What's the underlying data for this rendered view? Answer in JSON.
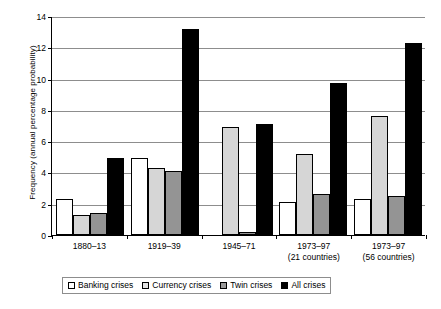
{
  "chart_data": {
    "type": "bar",
    "title": "",
    "xlabel": "",
    "ylabel": "Frequency (annual percentage probability)",
    "ylim": [
      0,
      14
    ],
    "ytick_step": 2,
    "yticks": [
      0,
      2,
      4,
      6,
      8,
      10,
      12,
      14
    ],
    "ytick_labels": [
      "0",
      "2",
      "4",
      "6",
      "8",
      "10",
      "12",
      "14"
    ],
    "grid": "horizontal",
    "legend_position": "bottom",
    "categories": [
      "1880–13",
      "1919–39",
      "1945–71",
      "1973–97",
      "1973–97"
    ],
    "category_sublabels": [
      "",
      "",
      "",
      "(21 countries)",
      "(56 countries)"
    ],
    "series": [
      {
        "name": "Banking crises",
        "color": "#ffffff",
        "values": [
          2.3,
          4.9,
          0.0,
          2.1,
          2.3
        ]
      },
      {
        "name": "Currency crises",
        "color": "#d6d6d6",
        "values": [
          1.3,
          4.3,
          6.9,
          5.2,
          7.6
        ]
      },
      {
        "name": "Twin crises",
        "color": "#949494",
        "values": [
          1.4,
          4.1,
          0.2,
          2.6,
          2.5
        ]
      },
      {
        "name": "All crises",
        "color": "#000000",
        "values": [
          4.9,
          13.2,
          7.1,
          9.7,
          12.3
        ]
      }
    ]
  },
  "legend": {
    "items": [
      {
        "label": "Banking crises",
        "swatch": "legend-swatch-banking"
      },
      {
        "label": "Currency crises",
        "swatch": "legend-swatch-currency"
      },
      {
        "label": "Twin crises",
        "swatch": "legend-swatch-twin"
      },
      {
        "label": "All crises",
        "swatch": "legend-swatch-all"
      }
    ]
  }
}
